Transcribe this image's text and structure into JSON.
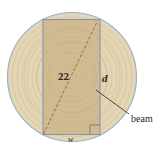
{
  "diagram": {
    "labels": {
      "diagonal": "22",
      "depth": "d",
      "width": "w",
      "beam": "beam"
    },
    "colors": {
      "log_fill": "#e3d6b4",
      "log_ring": "#d6c7a0",
      "log_edge": "#9fb0bf",
      "beam_fill": "#cdb78f",
      "beam_edge": "#8596b4",
      "diagonal": "#b05a3a",
      "text": "#2a2520"
    }
  }
}
